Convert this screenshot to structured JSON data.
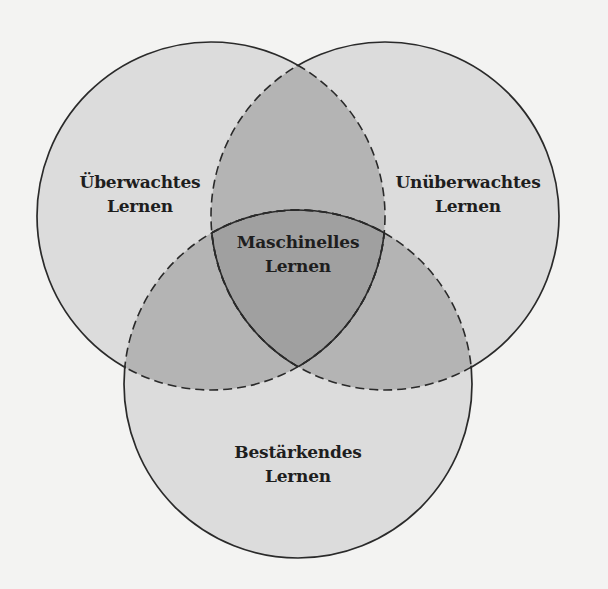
{
  "diagram": {
    "type": "venn-3",
    "colors": {
      "background": "#f3f3f2",
      "single_region": "#dcdcdc",
      "double_overlap": "#b4b4b4",
      "triple_overlap": "#a0a0a0",
      "stroke": "#2a2a2a"
    },
    "sets": [
      {
        "id": "supervised",
        "line1": "Überwachtes",
        "line2": "Lernen",
        "cx": 211,
        "cy": 216,
        "r": 174
      },
      {
        "id": "unsupervised",
        "line1": "Unüberwachtes",
        "line2": "Lernen",
        "cx": 385,
        "cy": 216,
        "r": 174
      },
      {
        "id": "reinforcement",
        "line1": "Bestärkendes",
        "line2": "Lernen",
        "cx": 298,
        "cy": 384,
        "r": 174
      }
    ],
    "center": {
      "line1": "Maschinelles",
      "line2": "Lernen"
    }
  }
}
